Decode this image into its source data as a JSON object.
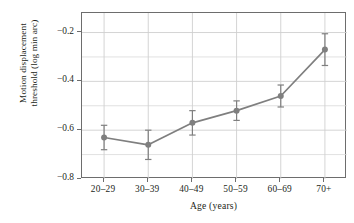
{
  "chart_data": {
    "type": "line",
    "title": "",
    "xlabel": "Age (years)",
    "ylabel_line1": "Motion displacement",
    "ylabel_line2": "threshold (log min arc)",
    "categories": [
      "20–29",
      "30–39",
      "40–49",
      "50–59",
      "60–69",
      "70+"
    ],
    "values": [
      -0.63,
      -0.66,
      -0.57,
      -0.52,
      -0.46,
      -0.27
    ],
    "error_upper": [
      0.05,
      0.06,
      0.05,
      0.04,
      0.045,
      0.065
    ],
    "error_lower": [
      0.05,
      0.06,
      0.05,
      0.04,
      0.045,
      0.065
    ],
    "ylim": [
      -0.8,
      -0.12
    ],
    "ytick_values": [
      -0.2,
      -0.4,
      -0.6,
      -0.8
    ],
    "ytick_labels": [
      "−0.2",
      "−0.4",
      "−0.6",
      "−0.8"
    ],
    "yminor_values": [
      -0.3,
      -0.5,
      -0.7
    ],
    "grid": "both-axes-light",
    "legend": "none",
    "series_color": "#7f7f7f",
    "marker": "circle",
    "axis_color": "#6d6d6d",
    "grid_color": "#d9d9d9",
    "text_color": "#231f20"
  }
}
